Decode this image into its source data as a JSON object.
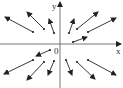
{
  "diagram": {
    "type": "vector-field",
    "axes": {
      "x_label": "x",
      "y_label": "y",
      "origin_label": "0",
      "origin": [
        60,
        44
      ]
    },
    "colors": {
      "line": "#222222",
      "background": "#ffffff"
    },
    "vectors": [
      {
        "from": [
          33,
          32
        ],
        "to": [
          5,
          17
        ]
      },
      {
        "from": [
          44,
          29
        ],
        "to": [
          27,
          12
        ]
      },
      {
        "from": [
          54,
          33
        ],
        "to": [
          49,
          19
        ]
      },
      {
        "from": [
          69,
          33
        ],
        "to": [
          74,
          19
        ]
      },
      {
        "from": [
          77,
          29
        ],
        "to": [
          98,
          12
        ]
      },
      {
        "from": [
          88,
          32
        ],
        "to": [
          116,
          18
        ]
      },
      {
        "from": [
          73,
          42
        ],
        "to": [
          87,
          37
        ]
      },
      {
        "from": [
          50,
          50
        ],
        "to": [
          36,
          56
        ]
      },
      {
        "from": [
          33,
          60
        ],
        "to": [
          4,
          74
        ]
      },
      {
        "from": [
          44,
          62
        ],
        "to": [
          27,
          80
        ]
      },
      {
        "from": [
          54,
          61
        ],
        "to": [
          48,
          75
        ]
      },
      {
        "from": [
          66,
          60
        ],
        "to": [
          72,
          75
        ]
      },
      {
        "from": [
          77,
          62
        ],
        "to": [
          95,
          79
        ]
      },
      {
        "from": [
          88,
          60
        ],
        "to": [
          116,
          75
        ]
      }
    ]
  }
}
